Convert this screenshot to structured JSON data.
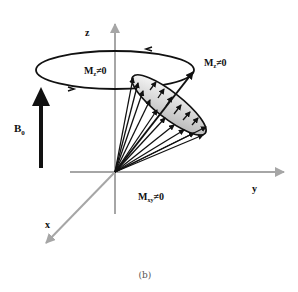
{
  "figure": {
    "caption": "(b)",
    "axes": {
      "z": "z",
      "y": "y",
      "x": "x"
    },
    "labels": {
      "b0_main": "B",
      "b0_sub": "0",
      "mz_inner_main": "M",
      "mz_inner_sub": "z",
      "mz_inner_rel": "≠0",
      "mz_outer_main": "M",
      "mz_outer_sub": "z",
      "mz_outer_rel": "≠0",
      "mxy_main": "M",
      "mxy_sub": "xy",
      "mxy_rel": "≠0"
    },
    "colors": {
      "axis": "#a6a6a6",
      "vector": "#111111",
      "cone_fill_light": "#ffffff",
      "cone_fill_dark": "#b8b8b8"
    }
  }
}
